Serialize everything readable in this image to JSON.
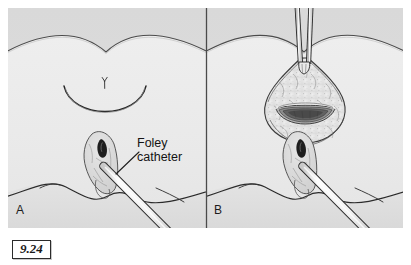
{
  "figure": {
    "number": "9.24",
    "panels": [
      {
        "id": "A",
        "letter": "A"
      },
      {
        "id": "B",
        "letter": "B"
      }
    ],
    "labels": {
      "foley_line1": "Foley",
      "foley_line2": "catheter"
    },
    "colors": {
      "plate_background": "#f2f2f2",
      "upper_tissue": "#dcdcdc",
      "lower_tissue": "#ebebeb",
      "ink": "#2a2a2a",
      "light_ink": "#6f6f6f",
      "cavity_dark": "#5a5a5a",
      "cavity_mid": "#8e8e8e",
      "cavity_light": "#c4c4c4",
      "catheter_fill": "#fbfbfb",
      "fat_tissue": "#e2e2e2",
      "divider": "#4a4a4a",
      "fignum_border": "#2b2b2b",
      "page_background": "#ffffff"
    },
    "caption_elements": {
      "panel_a_description": "Planned curved incision marked on abdominal wall with existing fistula tract and Foley catheter in place",
      "panel_b_description": "Incision opened showing subcutaneous fat and exposed cavity, retractor instrument in wound, Foley catheter in place"
    }
  }
}
